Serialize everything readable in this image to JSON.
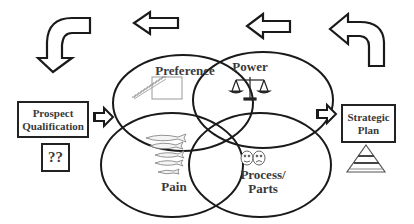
{
  "diagram": {
    "circles": [
      {
        "id": "preference",
        "label": "Preference",
        "icon": "staircase-icon"
      },
      {
        "id": "power",
        "label": "Power",
        "icon": "scales-icon"
      },
      {
        "id": "pain",
        "label": "Pain",
        "icon": "fish-school-icon"
      },
      {
        "id": "process",
        "label_line1": "Process/",
        "label_line2": "Parts",
        "icon": "theater-masks-icon"
      }
    ],
    "prospect_box": {
      "line1": "Prospect",
      "line2": "Qualification"
    },
    "question_box": {
      "label": "??"
    },
    "strategic_box": {
      "line1": "Strategic",
      "line2": "Plan",
      "icon": "pyramid-icon"
    },
    "arrows": [
      {
        "id": "curved-right-to-left",
        "direction": "left"
      },
      {
        "id": "top-arrow-2",
        "direction": "left"
      },
      {
        "id": "top-arrow-1",
        "direction": "left"
      },
      {
        "id": "curved-left-to-down",
        "direction": "down"
      },
      {
        "id": "prospect-to-venn",
        "direction": "right"
      },
      {
        "id": "venn-to-strategic",
        "direction": "right"
      }
    ],
    "colors": {
      "stroke": "#1a1a1a",
      "text": "#3a3a3a",
      "background": "#ffffff"
    }
  }
}
